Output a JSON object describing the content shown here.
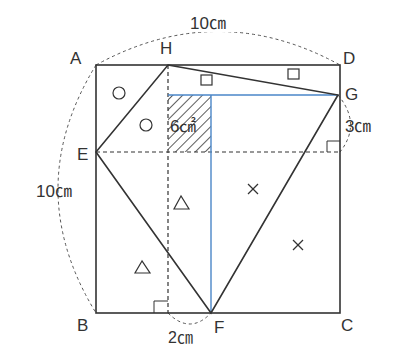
{
  "points": {
    "A": "A",
    "B": "B",
    "C": "C",
    "D": "D",
    "E": "E",
    "F": "F",
    "G": "G",
    "H": "H"
  },
  "measurements": {
    "top": "10㎝",
    "left": "10㎝",
    "right": "3㎝",
    "bottom": "2㎝",
    "shaded_area": "6㎠"
  },
  "markers": {
    "circle": "○",
    "square": "□",
    "triangle": "△",
    "cross": "×"
  },
  "colors": {
    "line": "#333333",
    "blue": "#4a86c8"
  }
}
